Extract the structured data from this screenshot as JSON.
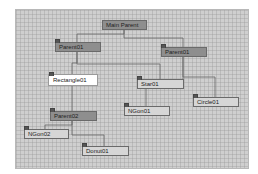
{
  "view": {
    "type": "schematic-hierarchy",
    "colors": {
      "canvas": "#cfcfcf",
      "parent_node": "#8e8e8e",
      "leaf_node": "#d6d6d6",
      "selected_node": "#ffffff",
      "link": "#666666"
    }
  },
  "nodes": [
    {
      "id": "main-parent",
      "label": "Main Parent",
      "kind": "parent",
      "selected": false
    },
    {
      "id": "parent01-left",
      "label": "Parent01",
      "kind": "parent",
      "selected": false
    },
    {
      "id": "parent01-right",
      "label": "Parent01",
      "kind": "parent",
      "selected": false
    },
    {
      "id": "rectangle01",
      "label": "Rectangle01",
      "kind": "leaf",
      "selected": true
    },
    {
      "id": "star01",
      "label": "Star01",
      "kind": "leaf",
      "selected": false
    },
    {
      "id": "circle01",
      "label": "Circle01",
      "kind": "leaf",
      "selected": false
    },
    {
      "id": "ngon01",
      "label": "NGon01",
      "kind": "leaf",
      "selected": false
    },
    {
      "id": "parent02",
      "label": "Parent02",
      "kind": "parent",
      "selected": false
    },
    {
      "id": "ngon02",
      "label": "NGon02",
      "kind": "leaf",
      "selected": false
    },
    {
      "id": "donut01",
      "label": "Donut01",
      "kind": "leaf",
      "selected": false
    }
  ]
}
